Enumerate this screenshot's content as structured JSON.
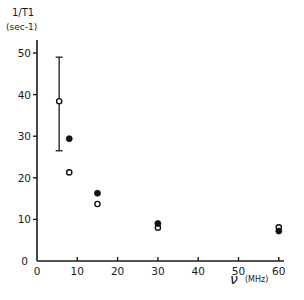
{
  "chart_data": {
    "type": "scatter",
    "title": "",
    "ylabel_line1": "1/T1",
    "ylabel_line2": "(sec-1)",
    "xlabel_symbol": "ν",
    "xlabel_unit": "(MHz)",
    "xlabel": "ν (MHz)",
    "ylabel": "1/T1 (sec-1)",
    "xlim": [
      0,
      62
    ],
    "ylim": [
      0,
      52
    ],
    "xticks": [
      0,
      10,
      20,
      30,
      40,
      50,
      60
    ],
    "yticks": [
      0,
      10,
      20,
      30,
      40,
      50
    ],
    "grid": false,
    "legend": "none",
    "series": [
      {
        "name": "open circles",
        "marker": "open-circle",
        "x": [
          5.5,
          8,
          15,
          30,
          60
        ],
        "y": [
          38.4,
          21.3,
          13.7,
          8.0,
          8.1
        ]
      },
      {
        "name": "filled circles",
        "marker": "filled-circle",
        "x": [
          8,
          15,
          30,
          60
        ],
        "y": [
          29.4,
          16.3,
          9.0,
          7.2
        ]
      }
    ],
    "error_bars": [
      {
        "x": 5.5,
        "y": 38.4,
        "low": 26.5,
        "high": 49.0
      }
    ]
  },
  "axis": {
    "origin_x_label": "0",
    "origin_y_label": "0"
  }
}
